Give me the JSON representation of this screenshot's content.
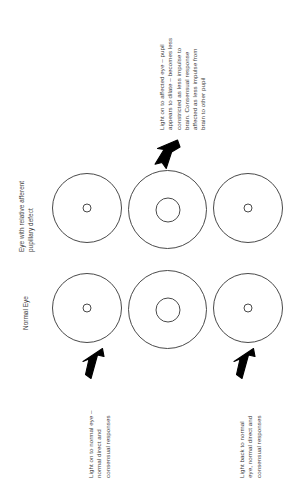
{
  "page": {
    "background_color": "#ffffff",
    "stroke_color": "#4a4a4a",
    "text_color": "#3d3d3d",
    "arrow_color": "#000000"
  },
  "row_labels": [
    {
      "id": "rapd-row",
      "lines": [
        "Eye with relative afferent",
        "pupillary defect"
      ]
    },
    {
      "id": "normal-row",
      "lines": [
        "Normal Eye"
      ]
    }
  ],
  "eyes": {
    "top_row": [
      {
        "id": "rapd-eye-step-1",
        "pupil": "small"
      },
      {
        "id": "rapd-eye-step-2",
        "pupil": "large"
      },
      {
        "id": "rapd-eye-step-3",
        "pupil": "small"
      }
    ],
    "bottom_row": [
      {
        "id": "normal-eye-step-1",
        "pupil": "small"
      },
      {
        "id": "normal-eye-step-2",
        "pupil": "large"
      },
      {
        "id": "normal-eye-step-3",
        "pupil": "small"
      }
    ]
  },
  "captions": {
    "affected_eye": {
      "id": "caption-affected-eye",
      "lines": [
        "Light on to affected eye – pupil",
        "appears to dilate – becomes less",
        "constricted as less impulse to",
        "brain. Consensual response",
        "affected as less impulse from",
        "brain to other pupil"
      ]
    },
    "normal_eye_first": {
      "id": "caption-normal-eye-first",
      "lines": [
        "Light on to normal eye –",
        "normal direct and",
        "consensual responses"
      ]
    },
    "normal_eye_back": {
      "id": "caption-normal-eye-back",
      "lines": [
        "Light back to normal",
        "eye, normal direct and",
        "consensual responses"
      ]
    }
  },
  "arrows": [
    {
      "id": "arrow-to-affected-eye",
      "direction": "down-left",
      "points_to": "rapd-eye-step-2"
    },
    {
      "id": "arrow-to-normal-eye-first",
      "direction": "up-right",
      "points_to": "normal-eye-step-1"
    },
    {
      "id": "arrow-to-normal-eye-back",
      "direction": "up-right",
      "points_to": "normal-eye-step-3"
    }
  ]
}
